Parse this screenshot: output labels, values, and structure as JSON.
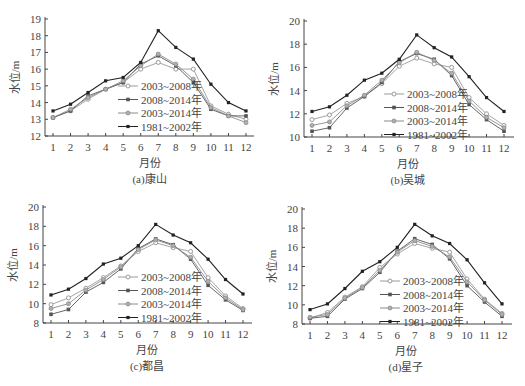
{
  "chart_data": [
    {
      "type": "line",
      "title": "(a)康山",
      "xlabel": "月份",
      "ylabel": "水位/m",
      "ylim": [
        12,
        19
      ],
      "yticks": [
        12,
        13,
        14,
        15,
        16,
        17,
        18,
        19
      ],
      "categories": [
        1,
        2,
        3,
        4,
        5,
        6,
        7,
        8,
        9,
        10,
        11,
        12
      ],
      "series": [
        {
          "name": "2003~2008年",
          "values": [
            13.1,
            13.5,
            14.2,
            14.8,
            15.2,
            16.0,
            16.4,
            16.0,
            16.0,
            13.8,
            13.3,
            13.0
          ]
        },
        {
          "name": "2008~2014年",
          "values": [
            13.1,
            13.5,
            14.4,
            14.8,
            15.2,
            16.3,
            16.8,
            16.2,
            15.2,
            13.6,
            13.2,
            13.2
          ]
        },
        {
          "name": "2003~2014年",
          "values": [
            13.1,
            13.6,
            14.3,
            14.8,
            15.3,
            16.2,
            16.9,
            16.3,
            15.4,
            13.7,
            13.2,
            12.8
          ]
        },
        {
          "name": "1981~2002年",
          "values": [
            13.5,
            13.9,
            14.6,
            15.3,
            15.5,
            16.4,
            18.3,
            17.3,
            16.6,
            15.1,
            14.0,
            13.5
          ]
        }
      ],
      "legend_position": "center"
    },
    {
      "type": "line",
      "title": "(b)吴城",
      "xlabel": "月份",
      "ylabel": "水位/m",
      "ylim": [
        10,
        20
      ],
      "yticks": [
        10,
        12,
        14,
        16,
        18,
        20
      ],
      "categories": [
        1,
        2,
        3,
        4,
        5,
        6,
        7,
        8,
        9,
        10,
        11,
        12
      ],
      "series": [
        {
          "name": "2003~2008年",
          "values": [
            11.5,
            11.9,
            12.9,
            13.5,
            14.6,
            16.1,
            16.8,
            16.3,
            16.0,
            13.4,
            12.0,
            11.0
          ]
        },
        {
          "name": "2008~2014年",
          "values": [
            10.5,
            10.8,
            12.5,
            13.5,
            14.7,
            16.5,
            17.2,
            16.7,
            15.3,
            12.8,
            11.5,
            10.5
          ]
        },
        {
          "name": "2003~2014年",
          "values": [
            11.0,
            11.3,
            12.7,
            13.6,
            14.9,
            16.4,
            17.3,
            16.6,
            15.5,
            13.1,
            11.7,
            10.8
          ]
        },
        {
          "name": "1981~2002年",
          "values": [
            12.2,
            12.6,
            13.6,
            14.9,
            15.5,
            16.7,
            18.8,
            17.7,
            16.9,
            15.2,
            13.4,
            12.2
          ]
        }
      ],
      "legend_position": "center"
    },
    {
      "type": "line",
      "title": "(c)都昌",
      "xlabel": "月份",
      "ylabel": "水位/m",
      "ylim": [
        8,
        20
      ],
      "yticks": [
        8,
        10,
        12,
        14,
        16,
        18,
        20
      ],
      "categories": [
        1,
        2,
        3,
        4,
        5,
        6,
        7,
        8,
        9,
        10,
        11,
        12
      ],
      "series": [
        {
          "name": "2003~2008年",
          "values": [
            9.9,
            10.6,
            11.6,
            12.7,
            13.9,
            15.4,
            16.3,
            15.8,
            15.4,
            12.7,
            10.8,
            9.5
          ]
        },
        {
          "name": "2008~2014年",
          "values": [
            8.9,
            9.4,
            11.2,
            12.2,
            13.6,
            15.7,
            16.7,
            16.1,
            14.6,
            11.9,
            10.4,
            9.3
          ]
        },
        {
          "name": "2003~2014年",
          "values": [
            9.5,
            10.0,
            11.4,
            12.5,
            13.8,
            15.6,
            16.6,
            16.0,
            14.8,
            12.3,
            10.6,
            9.4
          ]
        },
        {
          "name": "1981~2002年",
          "values": [
            10.9,
            11.5,
            12.6,
            14.1,
            14.7,
            16.0,
            18.2,
            17.1,
            16.3,
            14.6,
            12.5,
            11.0
          ]
        }
      ],
      "legend_position": "center"
    },
    {
      "type": "line",
      "title": "(d)星子",
      "xlabel": "月份",
      "ylabel": "水位/m",
      "ylim": [
        8,
        20
      ],
      "yticks": [
        8,
        10,
        12,
        14,
        16,
        18,
        20
      ],
      "categories": [
        1,
        2,
        3,
        4,
        5,
        6,
        7,
        8,
        9,
        10,
        11,
        12
      ],
      "series": [
        {
          "name": "2003~2008年",
          "values": [
            8.6,
            9.2,
            10.8,
            11.9,
            13.9,
            15.3,
            16.4,
            15.9,
            15.5,
            12.7,
            10.6,
            9.1
          ]
        },
        {
          "name": "2008~2014年",
          "values": [
            8.6,
            8.8,
            10.6,
            11.7,
            13.4,
            15.6,
            16.9,
            16.3,
            14.8,
            12.0,
            10.3,
            8.8
          ]
        },
        {
          "name": "2003~2014年",
          "values": [
            8.7,
            9.0,
            10.7,
            11.8,
            13.6,
            15.5,
            16.7,
            16.1,
            15.0,
            12.4,
            10.5,
            9.0
          ]
        },
        {
          "name": "1981~2002年",
          "values": [
            9.5,
            10.1,
            11.7,
            13.5,
            14.5,
            16.0,
            18.4,
            17.2,
            16.4,
            14.7,
            12.3,
            10.1
          ]
        }
      ],
      "legend_position": "center"
    }
  ],
  "series_styles": [
    {
      "color": "#9a9a9a",
      "marker": "open-circle"
    },
    {
      "color": "#555555",
      "marker": "filled-square"
    },
    {
      "color": "#8a8a8a",
      "marker": "filled-circle-gray"
    },
    {
      "color": "#222222",
      "marker": "filled-diamond"
    }
  ]
}
